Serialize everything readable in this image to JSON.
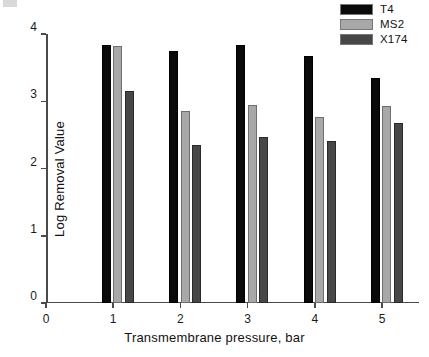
{
  "chart_data": {
    "type": "bar",
    "title": "",
    "subtitle": "",
    "xlabel": "Transmembrane pressure, bar",
    "ylabel": "Log Removal Value",
    "categories": [
      "1",
      "2",
      "3",
      "4",
      "5"
    ],
    "x_tick_labels": [
      "0",
      "1",
      "2",
      "3",
      "4",
      "5"
    ],
    "y_tick_labels": [
      "0",
      "1",
      "2",
      "3",
      "4"
    ],
    "xlim": [
      0,
      5.55
    ],
    "ylim": [
      0,
      4
    ],
    "grid": false,
    "legend_position": "top-right",
    "series": [
      {
        "name": "T4",
        "color": "#0a0a0a",
        "values": [
          3.83,
          3.75,
          3.84,
          3.67,
          3.35
        ]
      },
      {
        "name": "MS2",
        "color": "#a8a8a8",
        "values": [
          3.82,
          2.86,
          2.95,
          2.77,
          2.93
        ]
      },
      {
        "name": "X174",
        "color": "#474747",
        "values": [
          3.15,
          2.35,
          2.47,
          2.41,
          2.67
        ]
      }
    ]
  },
  "legend": {
    "items": [
      {
        "label": "T4",
        "swatch": "#0a0a0a"
      },
      {
        "label": "MS2",
        "swatch": "#a8a8a8"
      },
      {
        "label": "X174",
        "swatch": "#474747"
      }
    ]
  },
  "axes": {
    "y_title": "Log Removal Value",
    "x_title": "Transmembrane pressure, bar"
  }
}
